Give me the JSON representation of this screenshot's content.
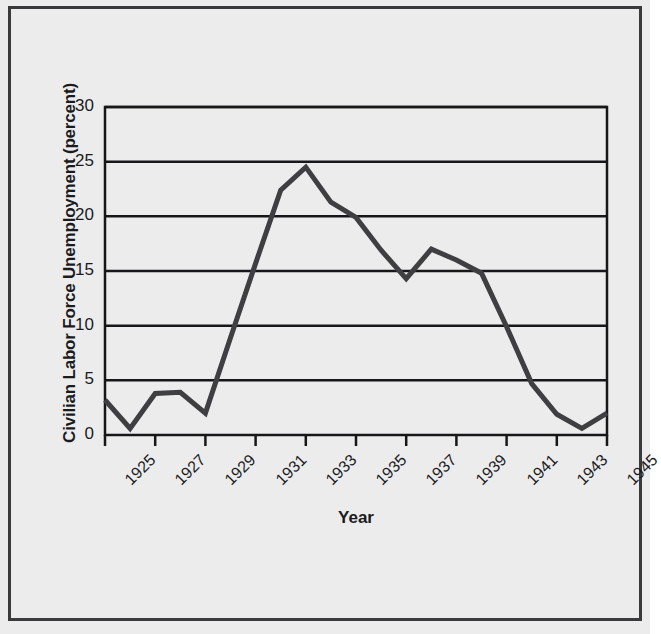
{
  "chart_data": {
    "type": "line",
    "title": "",
    "xlabel": "Year",
    "ylabel": "Civilian Labor Force Unemployment (percent)",
    "xlim": [
      1925,
      1945
    ],
    "ylim": [
      0,
      30
    ],
    "grid": "horizontal",
    "legend": "none",
    "ytick_labels": [
      "0",
      "5",
      "10",
      "15",
      "20",
      "25",
      "30"
    ],
    "ytick_values": [
      0,
      5,
      10,
      15,
      20,
      25,
      30
    ],
    "xtick_labels": [
      "1925",
      "1927",
      "1929",
      "1931",
      "1933",
      "1935",
      "1937",
      "1939",
      "1941",
      "1943",
      "1945"
    ],
    "xtick_values": [
      1925,
      1927,
      1929,
      1931,
      1933,
      1935,
      1937,
      1939,
      1941,
      1943,
      1945
    ],
    "x": [
      1925,
      1926,
      1927,
      1928,
      1929,
      1930,
      1931,
      1932,
      1933,
      1934,
      1935,
      1936,
      1937,
      1938,
      1939,
      1940,
      1941,
      1942,
      1943,
      1944,
      1945
    ],
    "values": [
      3.2,
      0.6,
      3.8,
      3.9,
      2.0,
      8.9,
      15.7,
      22.4,
      24.5,
      21.3,
      19.9,
      16.9,
      14.3,
      17.0,
      16.0,
      14.8,
      9.9,
      4.7,
      1.9,
      0.6,
      2.0
    ],
    "series": [
      {
        "name": "Civilian labor force unemployment",
        "color": "#3f3f42",
        "line_width": 5,
        "values": [
          3.2,
          0.6,
          3.8,
          3.9,
          2.0,
          8.9,
          15.7,
          22.4,
          24.5,
          21.3,
          19.9,
          16.9,
          14.3,
          17.0,
          16.0,
          14.8,
          9.9,
          4.7,
          1.9,
          0.6,
          2.0
        ]
      }
    ]
  },
  "figure": {
    "background_color": "#ececed",
    "border_color": "#3a3a3c",
    "axis_color": "#17171a",
    "text_color": "#1b1b1d"
  }
}
